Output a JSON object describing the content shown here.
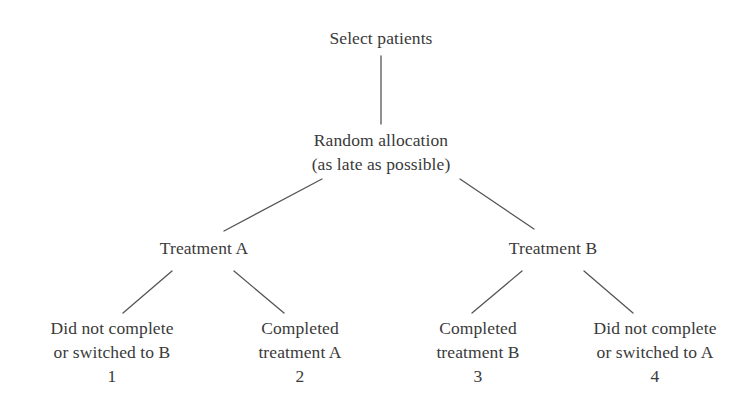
{
  "diagram": {
    "type": "flowchart",
    "background_color": "#ffffff",
    "text_color": "#3a3a3a",
    "line_color": "#555555",
    "nodes": {
      "root": {
        "label": "Select patients"
      },
      "allocation": {
        "line1": "Random allocation",
        "line2": "(as late as possible)"
      },
      "treatment_a": {
        "label": "Treatment A"
      },
      "treatment_b": {
        "label": "Treatment B"
      },
      "outcome_1": {
        "line1": "Did not complete",
        "line2": "or switched to B",
        "index": "1"
      },
      "outcome_2": {
        "line1": "Completed",
        "line2": "treatment A",
        "index": "2"
      },
      "outcome_3": {
        "line1": "Completed",
        "line2": "treatment B",
        "index": "3"
      },
      "outcome_4": {
        "line1": "Did not complete",
        "line2": "or switched to A",
        "index": "4"
      }
    }
  }
}
